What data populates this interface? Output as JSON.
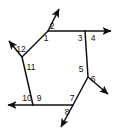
{
  "figure": {
    "type": "geometry-diagram",
    "shape": "hexagon",
    "background_color": "#ffffff",
    "line_color": "#111111",
    "label_color": "#111111"
  },
  "hexagon": {
    "vertices": [
      {
        "name": "top-left",
        "x": 48,
        "y": 31
      },
      {
        "name": "top-right",
        "x": 85,
        "y": 31
      },
      {
        "name": "right",
        "x": 88,
        "y": 77
      },
      {
        "name": "bottom-right",
        "x": 73,
        "y": 105
      },
      {
        "name": "bottom-left",
        "x": 33,
        "y": 105
      },
      {
        "name": "left",
        "x": 22,
        "y": 57
      }
    ]
  },
  "rays": [
    {
      "name": "ray-top-left-upward",
      "from_x": 48,
      "from_y": 31,
      "to_x": 60,
      "to_y": 7
    },
    {
      "name": "ray-top-right-rightward",
      "from_x": 85,
      "from_y": 31,
      "to_x": 116,
      "to_y": 31
    },
    {
      "name": "ray-right-downright",
      "from_x": 88,
      "from_y": 77,
      "to_x": 113,
      "to_y": 98
    },
    {
      "name": "ray-bottom-right-downleft",
      "from_x": 73,
      "from_y": 105,
      "to_x": 59,
      "to_y": 131
    },
    {
      "name": "ray-bottom-left-leftward",
      "from_x": 33,
      "from_y": 105,
      "to_x": 3,
      "to_y": 105
    },
    {
      "name": "ray-left-upleft",
      "from_x": 22,
      "from_y": 57,
      "to_x": 5,
      "to_y": 37
    }
  ],
  "angle_labels": [
    {
      "id": "angle-1",
      "text": "1",
      "x": 46,
      "y": 39
    },
    {
      "id": "angle-2",
      "text": "2",
      "x": 52,
      "y": 27
    },
    {
      "id": "angle-3",
      "text": "3",
      "x": 80,
      "y": 39
    },
    {
      "id": "angle-4",
      "text": "4",
      "x": 93,
      "y": 39
    },
    {
      "id": "angle-5",
      "text": "5",
      "x": 81,
      "y": 70
    },
    {
      "id": "angle-6",
      "text": "6",
      "x": 93,
      "y": 80
    },
    {
      "id": "angle-7",
      "text": "7",
      "x": 72,
      "y": 99
    },
    {
      "id": "angle-8",
      "text": "8",
      "x": 67,
      "y": 113
    },
    {
      "id": "angle-9",
      "text": "9",
      "x": 39,
      "y": 99
    },
    {
      "id": "angle-10",
      "text": "10",
      "x": 27,
      "y": 99
    },
    {
      "id": "angle-11",
      "text": "11",
      "x": 31,
      "y": 68
    },
    {
      "id": "angle-12",
      "text": "12",
      "x": 21,
      "y": 50
    }
  ]
}
